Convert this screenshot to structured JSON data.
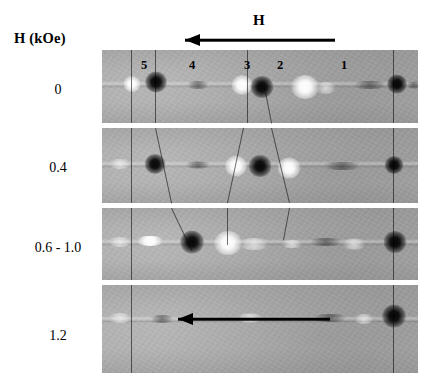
{
  "figure": {
    "axis_title": "H (kOe)",
    "field_arrow_label": "H",
    "background_color": "#ffffff",
    "panel_base_color": "#a9a9a9"
  },
  "column_labels": [
    {
      "text": "5",
      "x": 144
    },
    {
      "text": "4",
      "x": 192
    },
    {
      "text": "3",
      "x": 247
    },
    {
      "text": "2",
      "x": 280
    },
    {
      "text": "1",
      "x": 344
    }
  ],
  "top_arrow": {
    "label": "H",
    "label_x": 253,
    "label_y": 12,
    "x": 185,
    "y": 40,
    "length": 150,
    "direction": "left"
  },
  "inset_arrow": {
    "x": 178,
    "y": 319,
    "length": 152,
    "direction": "left"
  },
  "rows": [
    {
      "label": "0",
      "label_x": 58,
      "label_y": 82,
      "panel": {
        "x": 102,
        "y": 50,
        "width": 316,
        "height": 73
      },
      "wire_y": 34,
      "spots": [
        {
          "type": "bright",
          "x": 30,
          "y": 34,
          "w": 17,
          "h": 16
        },
        {
          "type": "dark",
          "x": 54,
          "y": 32,
          "w": 22,
          "h": 21
        },
        {
          "type": "faint-dark",
          "x": 96,
          "y": 35,
          "w": 26,
          "h": 8
        },
        {
          "type": "bright",
          "x": 140,
          "y": 35,
          "w": 21,
          "h": 20
        },
        {
          "type": "dark",
          "x": 160,
          "y": 37,
          "w": 23,
          "h": 22
        },
        {
          "type": "bright",
          "x": 203,
          "y": 37,
          "w": 28,
          "h": 24
        },
        {
          "type": "faint-bright",
          "x": 224,
          "y": 38,
          "w": 22,
          "h": 12
        },
        {
          "type": "faint-dark",
          "x": 268,
          "y": 35,
          "w": 40,
          "h": 8
        },
        {
          "type": "dark",
          "x": 295,
          "y": 34,
          "w": 20,
          "h": 19
        },
        {
          "type": "faint-dark",
          "x": 312,
          "y": 35,
          "w": 18,
          "h": 7
        }
      ]
    },
    {
      "label": "0.4",
      "label_x": 58,
      "label_y": 160,
      "panel": {
        "x": 102,
        "y": 128,
        "width": 316,
        "height": 75
      },
      "wire_y": 36,
      "spots": [
        {
          "type": "faint-bright",
          "x": 18,
          "y": 36,
          "w": 24,
          "h": 10
        },
        {
          "type": "dark",
          "x": 53,
          "y": 36,
          "w": 21,
          "h": 20
        },
        {
          "type": "faint-dark",
          "x": 96,
          "y": 37,
          "w": 30,
          "h": 7
        },
        {
          "type": "bright",
          "x": 134,
          "y": 38,
          "w": 22,
          "h": 21
        },
        {
          "type": "dark",
          "x": 158,
          "y": 38,
          "w": 23,
          "h": 22
        },
        {
          "type": "bright",
          "x": 187,
          "y": 40,
          "w": 23,
          "h": 21
        },
        {
          "type": "faint-dark",
          "x": 240,
          "y": 38,
          "w": 46,
          "h": 8
        },
        {
          "type": "dark",
          "x": 292,
          "y": 37,
          "w": 19,
          "h": 18
        }
      ]
    },
    {
      "label": "0.6 - 1.0",
      "label_x": 58,
      "label_y": 240,
      "panel": {
        "x": 102,
        "y": 208,
        "width": 316,
        "height": 72
      },
      "wire_y": 34,
      "spots": [
        {
          "type": "faint-bright",
          "x": 18,
          "y": 34,
          "w": 26,
          "h": 10
        },
        {
          "type": "bright",
          "x": 48,
          "y": 33,
          "w": 30,
          "h": 10
        },
        {
          "type": "dark",
          "x": 90,
          "y": 34,
          "w": 24,
          "h": 23
        },
        {
          "type": "bright",
          "x": 126,
          "y": 35,
          "w": 28,
          "h": 24
        },
        {
          "type": "faint-bright",
          "x": 152,
          "y": 36,
          "w": 34,
          "h": 12
        },
        {
          "type": "faint-bright",
          "x": 190,
          "y": 36,
          "w": 24,
          "h": 8
        },
        {
          "type": "faint-dark",
          "x": 224,
          "y": 34,
          "w": 40,
          "h": 8
        },
        {
          "type": "faint-bright",
          "x": 252,
          "y": 36,
          "w": 26,
          "h": 11
        },
        {
          "type": "dark",
          "x": 293,
          "y": 34,
          "w": 23,
          "h": 22
        }
      ]
    },
    {
      "label": "1.2",
      "label_x": 58,
      "label_y": 328,
      "panel": {
        "x": 102,
        "y": 285,
        "width": 316,
        "height": 88
      },
      "wire_y": 34,
      "spots": [
        {
          "type": "faint-bright",
          "x": 18,
          "y": 33,
          "w": 26,
          "h": 10
        },
        {
          "type": "faint-dark",
          "x": 60,
          "y": 34,
          "w": 28,
          "h": 8
        },
        {
          "type": "faint-bright",
          "x": 148,
          "y": 33,
          "w": 30,
          "h": 9
        },
        {
          "type": "faint-dark",
          "x": 228,
          "y": 33,
          "w": 40,
          "h": 8
        },
        {
          "type": "faint-bright",
          "x": 262,
          "y": 34,
          "w": 22,
          "h": 10
        },
        {
          "type": "dark",
          "x": 292,
          "y": 31,
          "w": 24,
          "h": 23
        }
      ]
    }
  ],
  "guide_lines": [
    {
      "x1": 132,
      "y1": 50,
      "x2": 132,
      "y2": 123
    },
    {
      "x1": 132,
      "y1": 128,
      "x2": 132,
      "y2": 203
    },
    {
      "x1": 132,
      "y1": 208,
      "x2": 132,
      "y2": 280
    },
    {
      "x1": 132,
      "y1": 285,
      "x2": 132,
      "y2": 373
    },
    {
      "x1": 156,
      "y1": 50,
      "x2": 156,
      "y2": 123
    },
    {
      "x1": 156,
      "y1": 128,
      "x2": 172,
      "y2": 203
    },
    {
      "x1": 172,
      "y1": 208,
      "x2": 192,
      "y2": 250
    },
    {
      "x1": 248,
      "y1": 50,
      "x2": 248,
      "y2": 123
    },
    {
      "x1": 244,
      "y1": 128,
      "x2": 228,
      "y2": 203
    },
    {
      "x1": 228,
      "y1": 208,
      "x2": 228,
      "y2": 245
    },
    {
      "x1": 266,
      "y1": 92,
      "x2": 272,
      "y2": 123
    },
    {
      "x1": 272,
      "y1": 128,
      "x2": 290,
      "y2": 203
    },
    {
      "x1": 290,
      "y1": 208,
      "x2": 284,
      "y2": 240
    },
    {
      "x1": 394,
      "y1": 50,
      "x2": 394,
      "y2": 123
    },
    {
      "x1": 394,
      "y1": 128,
      "x2": 394,
      "y2": 203
    },
    {
      "x1": 394,
      "y1": 208,
      "x2": 394,
      "y2": 280
    },
    {
      "x1": 394,
      "y1": 285,
      "x2": 394,
      "y2": 373
    }
  ]
}
